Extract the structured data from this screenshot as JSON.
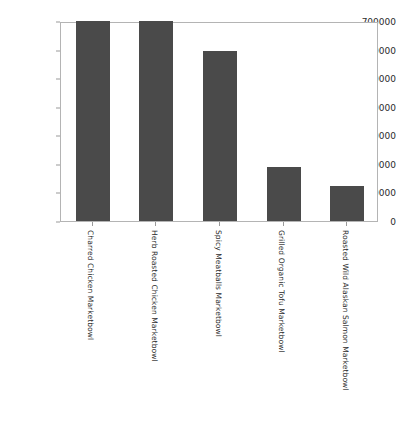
{
  "chart_data": {
    "type": "bar",
    "title": "",
    "title_clipped": true,
    "xlabel": "",
    "ylabel": "",
    "categories": [
      "Charred Chicken Marketbowl",
      "Herb Roasted Chicken Marketbowl",
      "Spicy Meatballs Marketbowl",
      "Grilled Organic Tofu Marketbowl",
      "Roasted Wild Alaskan Salmon Marketbowl"
    ],
    "values": [
      700000,
      700000,
      595000,
      190000,
      123000
    ],
    "ylim": [
      0,
      700000
    ],
    "yticks": [
      0,
      100000,
      200000,
      300000,
      400000,
      500000,
      600000,
      700000
    ],
    "ytick_labels": [
      "0",
      "100000",
      "200000",
      "300000",
      "400000",
      "500000",
      "600000",
      "700000"
    ],
    "grid": false,
    "legend": false,
    "bar_color": "#4a4a4a",
    "axis_color": "#b4b4b4",
    "tick_color": "#9a9a9a",
    "xtick_rotation": 90
  }
}
